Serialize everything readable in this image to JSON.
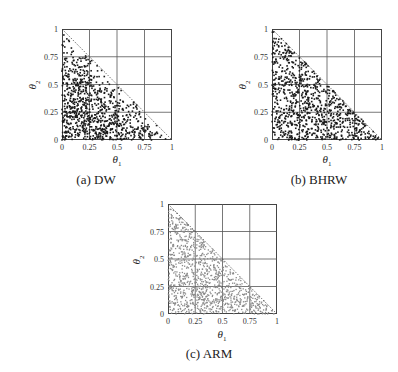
{
  "figure": {
    "panels": [
      {
        "id": "a",
        "caption": "(a) DW",
        "xlabel": "θ",
        "xlabel_sub": "1",
        "ylabel": "θ",
        "ylabel_sub": "2"
      },
      {
        "id": "b",
        "caption": "(b) BHRW",
        "xlabel": "θ",
        "xlabel_sub": "1",
        "ylabel": "θ",
        "ylabel_sub": "2"
      },
      {
        "id": "c",
        "caption": "(c) ARM",
        "xlabel": "θ",
        "xlabel_sub": "1",
        "ylabel": "θ",
        "ylabel_sub": "2"
      }
    ],
    "ticks": [
      "0",
      "0.25",
      "0.5",
      "0.75",
      "1"
    ]
  },
  "chart_data": [
    {
      "type": "scatter",
      "title": "(a) DW",
      "xlabel": "θ1",
      "ylabel": "θ2",
      "xlim": [
        0,
        1
      ],
      "ylim": [
        0,
        1
      ],
      "xticks": [
        0,
        0.25,
        0.5,
        0.75,
        1
      ],
      "yticks": [
        0,
        0.25,
        0.5,
        0.75,
        1
      ],
      "grid": true,
      "constraint_line": {
        "from": [
          0,
          1
        ],
        "to": [
          1,
          0
        ],
        "style": "dotted"
      },
      "point_color": "#1a1a1a",
      "distribution": "samples in simplex θ1+θ2<=1, concentrated away from the diagonal edge and near axes; sparse near (0,1) corner",
      "approx_points": 900
    },
    {
      "type": "scatter",
      "title": "(b) BHRW",
      "xlabel": "θ1",
      "ylabel": "θ2",
      "xlim": [
        0,
        1
      ],
      "ylim": [
        0,
        1
      ],
      "xticks": [
        0,
        0.25,
        0.5,
        0.75,
        1
      ],
      "yticks": [
        0,
        0.25,
        0.5,
        0.75,
        1
      ],
      "grid": true,
      "constraint_line": {
        "from": [
          0,
          1
        ],
        "to": [
          1,
          0
        ],
        "style": "dotted"
      },
      "point_color": "#1a1a1a",
      "distribution": "roughly uniform samples over simplex θ1+θ2<=1, filling up to the diagonal edge",
      "approx_points": 900
    },
    {
      "type": "scatter",
      "title": "(c) ARM",
      "xlabel": "θ1",
      "ylabel": "θ2",
      "xlim": [
        0,
        1
      ],
      "ylim": [
        0,
        1
      ],
      "xticks": [
        0,
        0.25,
        0.5,
        0.75,
        1
      ],
      "yticks": [
        0,
        0.25,
        0.5,
        0.75,
        1
      ],
      "grid": true,
      "constraint_line": {
        "from": [
          0,
          1
        ],
        "to": [
          1,
          0
        ],
        "style": "dotted"
      },
      "point_color": "#8a8a8a",
      "distribution": "uniform samples over simplex θ1+θ2<=1, lighter gray points",
      "approx_points": 1100
    }
  ]
}
